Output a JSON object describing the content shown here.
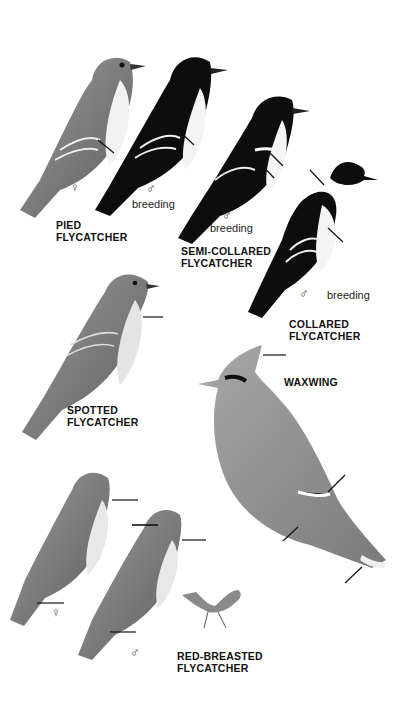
{
  "plate": {
    "background": "#ffffff",
    "species": [
      {
        "id": "pied",
        "label_line1": "PIED",
        "label_line2": "FLYCATCHER",
        "figures": [
          {
            "sex": "♀",
            "note": ""
          },
          {
            "sex": "♂",
            "note": "breeding"
          }
        ]
      },
      {
        "id": "semi-collared",
        "label_line1": "SEMI-COLLARED",
        "label_line2": "FLYCATCHER",
        "figures": [
          {
            "sex": "♂",
            "note": "breeding"
          }
        ]
      },
      {
        "id": "collared",
        "label_line1": "COLLARED",
        "label_line2": "FLYCATCHER",
        "figures": [
          {
            "sex": "♂",
            "note": "breeding"
          }
        ]
      },
      {
        "id": "spotted",
        "label_line1": "SPOTTED",
        "label_line2": "FLYCATCHER",
        "figures": [
          {
            "sex": "",
            "note": ""
          }
        ]
      },
      {
        "id": "waxwing",
        "label_line1": "WAXWING",
        "label_line2": "",
        "figures": [
          {
            "sex": "",
            "note": ""
          }
        ]
      },
      {
        "id": "red-breasted",
        "label_line1": "RED-BREASTED",
        "label_line2": "FLYCATCHER",
        "figures": [
          {
            "sex": "♀",
            "note": ""
          },
          {
            "sex": "♂",
            "note": ""
          },
          {
            "sex": "",
            "note": "flight/perched small"
          }
        ]
      }
    ],
    "colors": {
      "ink": "#111111",
      "grey_bird": "#8a8a8a",
      "light_grey": "#c9c9c9",
      "black_bird": "#0d0d0d"
    }
  }
}
